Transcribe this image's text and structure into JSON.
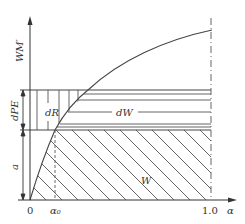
{
  "diagram": {
    "type": "watershed storage capacity curve",
    "labels": {
      "y_axis": "WM′",
      "dPE": "dPE",
      "a": "a",
      "dR": "dR",
      "dW": "dW",
      "W": "W",
      "origin": "0",
      "alpha0": "α₀",
      "x_tick_end": "1.0",
      "x_axis": "α"
    },
    "colors": {
      "line": "#444444",
      "background": "#ffffff"
    }
  }
}
